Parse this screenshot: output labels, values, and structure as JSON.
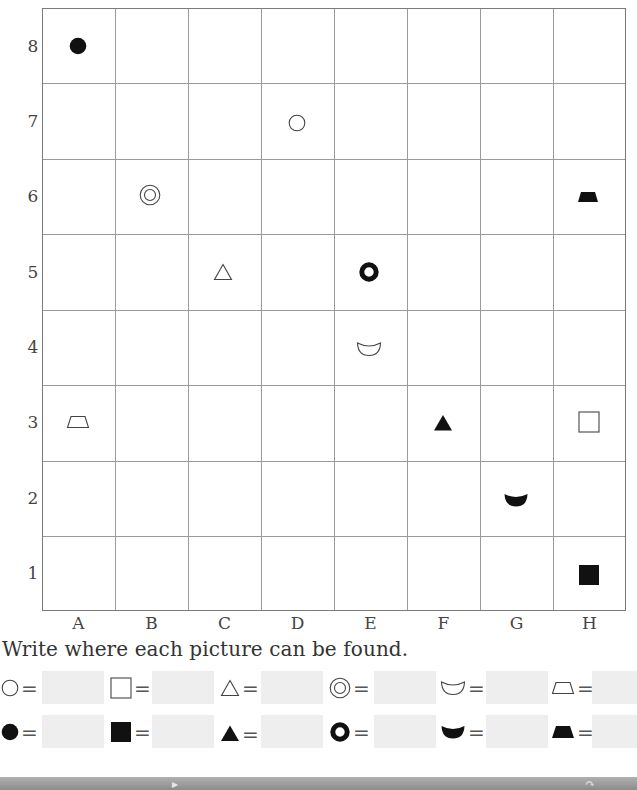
{
  "grid": {
    "columns": [
      "A",
      "B",
      "C",
      "D",
      "E",
      "F",
      "G",
      "H"
    ],
    "rows": [
      "8",
      "7",
      "6",
      "5",
      "4",
      "3",
      "2",
      "1"
    ],
    "placements": [
      {
        "shape": "filled-circle",
        "col": "A",
        "row": "8"
      },
      {
        "shape": "open-circle",
        "col": "D",
        "row": "7"
      },
      {
        "shape": "double-circle",
        "col": "B",
        "row": "6"
      },
      {
        "shape": "filled-trapezoid",
        "col": "H",
        "row": "6"
      },
      {
        "shape": "open-triangle",
        "col": "C",
        "row": "5"
      },
      {
        "shape": "thick-ring",
        "col": "E",
        "row": "5"
      },
      {
        "shape": "open-crescent",
        "col": "E",
        "row": "4"
      },
      {
        "shape": "open-trapezoid",
        "col": "A",
        "row": "3"
      },
      {
        "shape": "filled-triangle",
        "col": "F",
        "row": "3"
      },
      {
        "shape": "open-square",
        "col": "H",
        "row": "3"
      },
      {
        "shape": "filled-crescent",
        "col": "G",
        "row": "2"
      },
      {
        "shape": "filled-square",
        "col": "H",
        "row": "1"
      }
    ]
  },
  "instruction": "Write where each picture can be found.",
  "legend": {
    "equals_sign": "=",
    "row1": [
      {
        "shape": "open-circle",
        "answer": ""
      },
      {
        "shape": "open-square",
        "answer": ""
      },
      {
        "shape": "open-triangle",
        "answer": ""
      },
      {
        "shape": "double-circle",
        "answer": ""
      },
      {
        "shape": "open-crescent",
        "answer": ""
      },
      {
        "shape": "open-trapezoid",
        "answer": ""
      }
    ],
    "row2": [
      {
        "shape": "filled-circle",
        "answer": ""
      },
      {
        "shape": "filled-square",
        "answer": ""
      },
      {
        "shape": "filled-triangle",
        "answer": ""
      },
      {
        "shape": "thick-ring",
        "answer": ""
      },
      {
        "shape": "filled-crescent",
        "answer": ""
      },
      {
        "shape": "filled-trapezoid",
        "answer": ""
      }
    ]
  },
  "colors": {
    "grid_line": "#9a9a9a",
    "grid_border": "#7a7a7a",
    "answer_box": "#eeeeee",
    "shape_ink": "#111111",
    "footer_band": "#8c8c8c"
  }
}
